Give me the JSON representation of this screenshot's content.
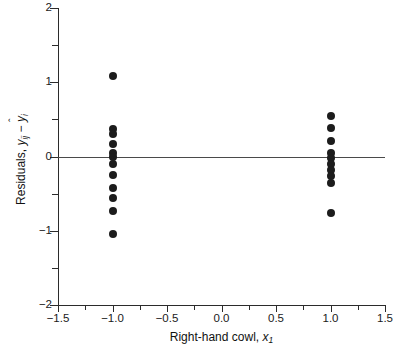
{
  "chart_data": {
    "type": "scatter",
    "title": "",
    "xlabel": "Right-hand cowl, x₁",
    "ylabel": "Residuals, yᵢⱼ − ŷᵢ",
    "xlim": [
      -1.5,
      1.5
    ],
    "ylim": [
      -2,
      2
    ],
    "grid": false,
    "legend": "none",
    "reference_line": {
      "axis": "horizontal",
      "value": 0
    },
    "xticks": [
      -1.5,
      -1.0,
      -0.5,
      0.0,
      0.5,
      1.0,
      1.5
    ],
    "xticklabels": [
      "-1.5",
      "-1.0",
      "-0.5",
      "0.0",
      "0.5",
      "1.0",
      "1.5"
    ],
    "xminorticks": [
      -1.25,
      -0.75,
      -0.25,
      0.25,
      0.75,
      1.25
    ],
    "yticks": [
      -2,
      -1,
      0,
      1,
      2
    ],
    "yticklabels": [
      "-2",
      "-1",
      "0",
      "1",
      "2"
    ],
    "yminorticks": [
      -1.5,
      -0.5,
      0.5,
      1.5
    ],
    "series": [
      {
        "name": "residuals",
        "marker": "filled-circle",
        "color": "#1c1c1c",
        "points": [
          {
            "x": -1.0,
            "y": 1.09
          },
          {
            "x": -1.0,
            "y": 0.37
          },
          {
            "x": -1.0,
            "y": 0.3
          },
          {
            "x": -1.0,
            "y": 0.17
          },
          {
            "x": -1.0,
            "y": 0.05
          },
          {
            "x": -1.0,
            "y": 0.0
          },
          {
            "x": -1.0,
            "y": -0.1
          },
          {
            "x": -1.0,
            "y": -0.25
          },
          {
            "x": -1.0,
            "y": -0.42
          },
          {
            "x": -1.0,
            "y": -0.56
          },
          {
            "x": -1.0,
            "y": -0.73
          },
          {
            "x": -1.0,
            "y": -1.05
          },
          {
            "x": 1.0,
            "y": 0.55
          },
          {
            "x": 1.0,
            "y": 0.38
          },
          {
            "x": 1.0,
            "y": 0.21
          },
          {
            "x": 1.0,
            "y": 0.05
          },
          {
            "x": 1.0,
            "y": -0.02
          },
          {
            "x": 1.0,
            "y": -0.1
          },
          {
            "x": 1.0,
            "y": -0.18
          },
          {
            "x": 1.0,
            "y": -0.26
          },
          {
            "x": 1.0,
            "y": -0.36
          },
          {
            "x": 1.0,
            "y": -0.76
          }
        ]
      }
    ]
  },
  "axis_titles": {
    "x_prefix": "Right-hand cowl, ",
    "x_var": "x",
    "x_sub": "1",
    "y_prefix": "Residuals, ",
    "y_var1": "y",
    "y_sub1": "ij",
    "y_minus": " − ",
    "y_var2": "y",
    "y_hat": "ˆ",
    "y_sub2": "i"
  }
}
